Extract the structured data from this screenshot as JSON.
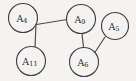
{
  "figure": {
    "type": "undirected-graph",
    "width": 136,
    "height": 81,
    "background_color": "#f4f3f1",
    "stroke_color": "#434343",
    "label_color": "#2c2c2c"
  },
  "graph_data": {
    "type": "node-link",
    "directed": false,
    "node_count": 5,
    "edge_count": 4,
    "nodes": [
      {
        "id": "A4",
        "base": "A",
        "subscript": "4",
        "label": "A4",
        "cx": 23,
        "cy": 18,
        "r": 14.5
      },
      {
        "id": "A9",
        "base": "A",
        "subscript": "9",
        "label": "A9",
        "cx": 81,
        "cy": 19,
        "r": 14.5
      },
      {
        "id": "A5",
        "base": "A",
        "subscript": "5",
        "label": "A5",
        "cx": 115,
        "cy": 26,
        "r": 13.5
      },
      {
        "id": "A11",
        "base": "A",
        "subscript": "11",
        "label": "A11",
        "cx": 31,
        "cy": 61,
        "r": 14.5
      },
      {
        "id": "A6",
        "base": "A",
        "subscript": "6",
        "label": "A6",
        "cx": 84,
        "cy": 62,
        "r": 14.5
      }
    ],
    "edges": [
      {
        "id": "edge-a4-a9",
        "source": "A4",
        "target": "A9",
        "x1": 36.5,
        "y1": 24.5,
        "x2": 67.0,
        "y2": 19.5
      },
      {
        "id": "edge-a4-a11",
        "source": "A4",
        "target": "A11",
        "x1": 36.0,
        "y1": 24.0,
        "x2": 35.0,
        "y2": 47.5
      },
      {
        "id": "edge-a9-a6",
        "source": "A9",
        "target": "A6",
        "x1": 82.0,
        "y1": 33.5,
        "x2": 83.5,
        "y2": 47.5
      },
      {
        "id": "edge-a5-a6",
        "source": "A5",
        "target": "A6",
        "x1": 105.0,
        "y1": 37.0,
        "x2": 94.5,
        "y2": 53.0
      }
    ]
  }
}
